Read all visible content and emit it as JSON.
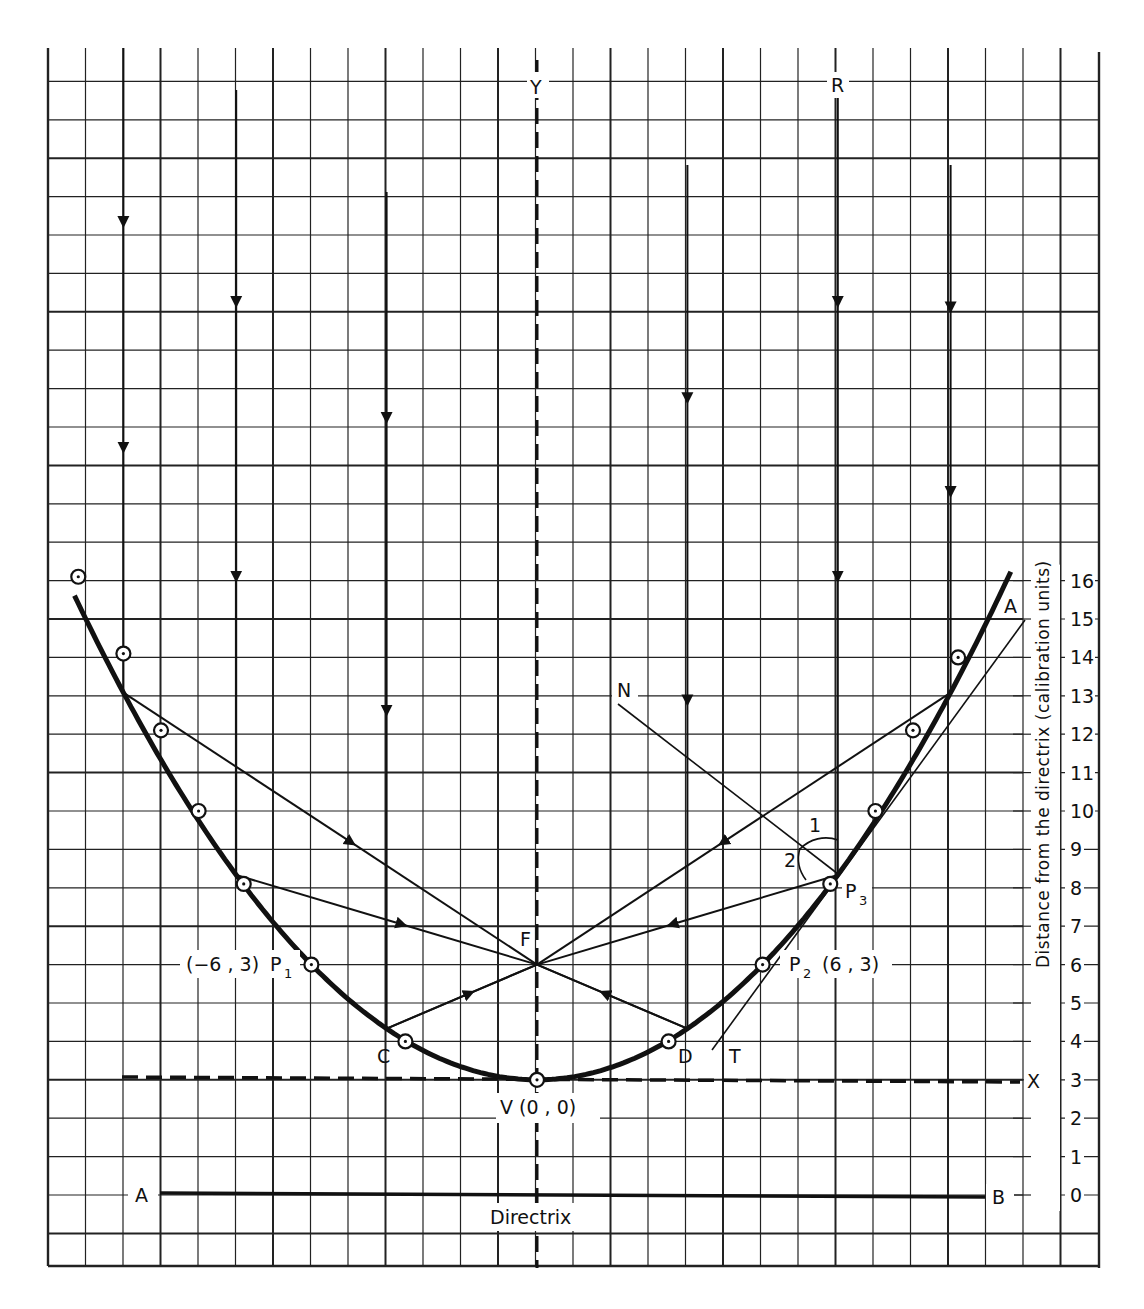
{
  "chart_data": {
    "type": "diagram",
    "title": "",
    "ylabel": "Distance from the directrix (calibration units)",
    "y_ticks": [
      "0",
      "1",
      "2",
      "3",
      "4",
      "5",
      "6",
      "7",
      "8",
      "9",
      "10",
      "11",
      "12",
      "13",
      "14",
      "15",
      "16"
    ],
    "ylim": [
      0,
      16
    ],
    "directrix": {
      "label": "Directrix",
      "value": 0,
      "end_labels": [
        "A",
        "B"
      ]
    },
    "x_axis_line": {
      "label": "X",
      "value": 3
    },
    "y_axis_line": {
      "label": "Y"
    },
    "vertex": {
      "label": "V (0, 0)",
      "x": 0,
      "y": 3
    },
    "focus": {
      "label": "F",
      "x": 0,
      "y": 6
    },
    "parabola_equation": "y = 3 + x^2/12 (calibration units, directrix at 0)",
    "plotted_points": [
      {
        "x": -12.2,
        "y": 16.1
      },
      {
        "x": -11.0,
        "y": 14.1
      },
      {
        "x": -10.0,
        "y": 12.1
      },
      {
        "x": -9.0,
        "y": 10.0
      },
      {
        "x": -7.8,
        "y": 8.1
      },
      {
        "x": -6.0,
        "y": 6.0,
        "label": "P1",
        "coord": "(-6, 3)"
      },
      {
        "x": -3.5,
        "y": 4.0,
        "label": "C"
      },
      {
        "x": 0,
        "y": 3.0,
        "label": "V"
      },
      {
        "x": 3.5,
        "y": 4.0,
        "label": "D"
      },
      {
        "x": 6.0,
        "y": 6.0,
        "label": "P2",
        "coord": "(6, 3)"
      },
      {
        "x": 7.8,
        "y": 8.1,
        "label": "P3"
      },
      {
        "x": 9.0,
        "y": 10.0
      },
      {
        "x": 10.0,
        "y": 12.1
      },
      {
        "x": 11.2,
        "y": 14.0
      }
    ],
    "incident_rays_x": [
      -11,
      -8,
      -4,
      4,
      8,
      11
    ],
    "annotations": [
      "N",
      "R",
      "T",
      "A",
      "1",
      "2",
      "C",
      "D",
      "F",
      "P1",
      "P2",
      "P3"
    ]
  },
  "labels": {
    "Y": "Y",
    "R": "R",
    "N": "N",
    "A_top": "A",
    "T": "T",
    "F": "F",
    "C": "C",
    "D": "D",
    "angle1": "1",
    "angle2": "2",
    "P1_coord": "(−6 , 3)",
    "P1": "P",
    "P1_sub": "1",
    "P2": "P",
    "P2_sub": "2",
    "P2_coord": "(6 , 3)",
    "P3": "P",
    "P3_sub": "3",
    "V": "V (0 , 0)",
    "X": "X",
    "A_dir": "A",
    "B_dir": "B",
    "directrix": "Directrix",
    "axis_title": "Distance from the directrix (calibration units)"
  }
}
